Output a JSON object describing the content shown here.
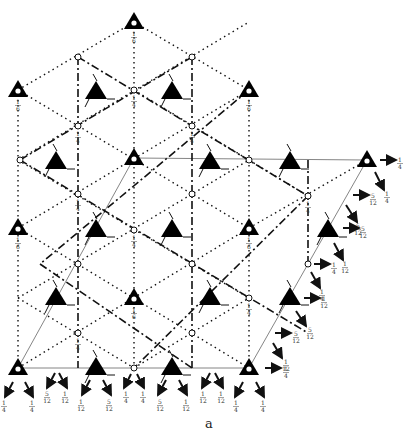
{
  "figure": {
    "type": "space-group symmetry-element diagram",
    "axis_label": "a",
    "colors": {
      "line": "#111111",
      "thin_line": "#555555",
      "background": "#ffffff"
    }
  },
  "threefold_axes": [
    {
      "x": 134,
      "y": 22,
      "label": "1/6"
    },
    {
      "x": 18,
      "y": 90,
      "label": "1/6"
    },
    {
      "x": 249,
      "y": 90,
      "label": "1/6"
    },
    {
      "x": 134,
      "y": 158,
      "label": ""
    },
    {
      "x": 367,
      "y": 160,
      "label": ""
    },
    {
      "x": 18,
      "y": 228,
      "label": "1/6"
    },
    {
      "x": 249,
      "y": 228,
      "label": "1/6"
    },
    {
      "x": 134,
      "y": 298,
      "label": "1/6"
    },
    {
      "x": 18,
      "y": 368,
      "label": ""
    },
    {
      "x": 249,
      "y": 368,
      "label": ""
    }
  ],
  "screw_axes": [
    {
      "x": 96,
      "y": 92
    },
    {
      "x": 172,
      "y": 92
    },
    {
      "x": 56,
      "y": 162
    },
    {
      "x": 210,
      "y": 162
    },
    {
      "x": 290,
      "y": 162
    },
    {
      "x": 96,
      "y": 230
    },
    {
      "x": 172,
      "y": 230
    },
    {
      "x": 328,
      "y": 230
    },
    {
      "x": 56,
      "y": 298
    },
    {
      "x": 210,
      "y": 298
    },
    {
      "x": 290,
      "y": 298
    },
    {
      "x": 96,
      "y": 368
    },
    {
      "x": 172,
      "y": 368
    }
  ],
  "inversion_points": [
    {
      "x": 78,
      "y": 57,
      "label": ""
    },
    {
      "x": 192,
      "y": 57,
      "label": ""
    },
    {
      "x": 134,
      "y": 90,
      "label": "1/4"
    },
    {
      "x": 78,
      "y": 126,
      "label": "1/4"
    },
    {
      "x": 192,
      "y": 126,
      "label": "1/4"
    },
    {
      "x": 20,
      "y": 160,
      "label": ""
    },
    {
      "x": 249,
      "y": 160,
      "label": ""
    },
    {
      "x": 78,
      "y": 194,
      "label": "1/4"
    },
    {
      "x": 192,
      "y": 194,
      "label": ""
    },
    {
      "x": 308,
      "y": 196,
      "label": "1/4"
    },
    {
      "x": 134,
      "y": 230,
      "label": "1/4"
    },
    {
      "x": 78,
      "y": 264,
      "label": ""
    },
    {
      "x": 192,
      "y": 264,
      "label": ""
    },
    {
      "x": 308,
      "y": 264,
      "label": ""
    },
    {
      "x": 249,
      "y": 298,
      "label": "1/4"
    },
    {
      "x": 78,
      "y": 333,
      "label": "1/4"
    },
    {
      "x": 192,
      "y": 333,
      "label": ""
    },
    {
      "x": 134,
      "y": 368,
      "label": ""
    }
  ],
  "edge_arrows": [
    {
      "x1": 380,
      "y1": 160,
      "x2": 396,
      "y2": 160,
      "label": "1/4",
      "lx": 400,
      "ly": 162
    },
    {
      "x1": 375,
      "y1": 172,
      "x2": 384,
      "y2": 190,
      "label": "1/4",
      "lx": 387,
      "ly": 196
    },
    {
      "x1": 353,
      "y1": 195,
      "x2": 369,
      "y2": 195,
      "label": "5/12",
      "lx": 373,
      "ly": 198
    },
    {
      "x1": 346,
      "y1": 205,
      "x2": 357,
      "y2": 222,
      "label": "5/12",
      "lx": 358,
      "ly": 228
    },
    {
      "x1": 343,
      "y1": 228,
      "x2": 359,
      "y2": 228,
      "label": "5/12",
      "lx": 363,
      "ly": 231
    },
    {
      "x1": 334,
      "y1": 243,
      "x2": 343,
      "y2": 260,
      "label": "1/12",
      "lx": 345,
      "ly": 266
    },
    {
      "x1": 314,
      "y1": 264,
      "x2": 330,
      "y2": 264,
      "label": "1/4",
      "lx": 334,
      "ly": 267
    },
    {
      "x1": 311,
      "y1": 272,
      "x2": 320,
      "y2": 288,
      "label": "1/4",
      "lx": 322,
      "ly": 294
    },
    {
      "x1": 304,
      "y1": 298,
      "x2": 320,
      "y2": 298,
      "label": "1/12",
      "lx": 324,
      "ly": 301
    },
    {
      "x1": 296,
      "y1": 311,
      "x2": 306,
      "y2": 326,
      "label": "5/12",
      "lx": 310,
      "ly": 332
    },
    {
      "x1": 275,
      "y1": 333,
      "x2": 291,
      "y2": 333,
      "label": "5/12",
      "lx": 296,
      "ly": 336
    },
    {
      "x1": 273,
      "y1": 343,
      "x2": 282,
      "y2": 358,
      "label": "1/12",
      "lx": 286,
      "ly": 364
    },
    {
      "x1": 265,
      "y1": 368,
      "x2": 281,
      "y2": 368,
      "label": "1/4",
      "lx": 286,
      "ly": 371
    }
  ],
  "bottom_arrows": [
    {
      "x1": 13,
      "y1": 382,
      "x2": 5,
      "y2": 397,
      "label": "1/4",
      "lx": 4,
      "ly": 405
    },
    {
      "x1": 25,
      "y1": 382,
      "x2": 33,
      "y2": 397,
      "label": "1/4",
      "lx": 32,
      "ly": 405
    },
    {
      "x1": 55,
      "y1": 373,
      "x2": 47,
      "y2": 388,
      "label": "5/12",
      "lx": 47,
      "ly": 396
    },
    {
      "x1": 59,
      "y1": 373,
      "x2": 67,
      "y2": 388,
      "label": "1/12",
      "lx": 65,
      "ly": 396
    },
    {
      "x1": 90,
      "y1": 380,
      "x2": 82,
      "y2": 395,
      "label": "1/12",
      "lx": 81,
      "ly": 404
    },
    {
      "x1": 103,
      "y1": 380,
      "x2": 111,
      "y2": 395,
      "label": "5/12",
      "lx": 109,
      "ly": 404
    },
    {
      "x1": 131,
      "y1": 374,
      "x2": 124,
      "y2": 388,
      "label": "1/4",
      "lx": 126,
      "ly": 396
    },
    {
      "x1": 137,
      "y1": 374,
      "x2": 144,
      "y2": 388,
      "label": "1/4",
      "lx": 143,
      "ly": 396
    },
    {
      "x1": 166,
      "y1": 380,
      "x2": 158,
      "y2": 395,
      "label": "5/12",
      "lx": 160,
      "ly": 404
    },
    {
      "x1": 179,
      "y1": 380,
      "x2": 187,
      "y2": 395,
      "label": "1/12",
      "lx": 186,
      "ly": 404
    },
    {
      "x1": 210,
      "y1": 373,
      "x2": 202,
      "y2": 388,
      "label": "1/12",
      "lx": 203,
      "ly": 396
    },
    {
      "x1": 215,
      "y1": 373,
      "x2": 223,
      "y2": 388,
      "label": "1/12",
      "lx": 221,
      "ly": 396
    },
    {
      "x1": 243,
      "y1": 382,
      "x2": 235,
      "y2": 397,
      "label": "1/4",
      "lx": 236,
      "ly": 405
    },
    {
      "x1": 256,
      "y1": 382,
      "x2": 264,
      "y2": 397,
      "label": "1/4",
      "lx": 263,
      "ly": 405
    }
  ]
}
